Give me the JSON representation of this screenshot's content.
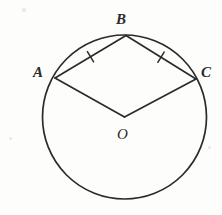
{
  "figure": {
    "kind": "circle-geometry-diagram",
    "background_color": "#fdfdfc",
    "ink_color": "#2b2b2b",
    "width": 222,
    "height": 215,
    "circle": {
      "center_x": 124.5,
      "center_y": 117,
      "radius": 82,
      "stroke_width": 1.7
    },
    "points": [
      {
        "name": "A",
        "x": 55,
        "y": 78,
        "label": "A",
        "label_x": 33,
        "label_y": 65
      },
      {
        "name": "B",
        "x": 126,
        "y": 35.5,
        "label": "B",
        "label_x": 116,
        "label_y": 12
      },
      {
        "name": "C",
        "x": 196,
        "y": 79,
        "label": "C",
        "label_x": 201,
        "label_y": 65
      },
      {
        "name": "O",
        "x": 124.5,
        "y": 117,
        "label": "O",
        "label_x": 117,
        "label_y": 127
      }
    ],
    "segments": [
      {
        "name": "chord-AB",
        "from": "A",
        "to": "B",
        "ticks": 1
      },
      {
        "name": "chord-BC",
        "from": "B",
        "to": "C",
        "ticks": 1
      },
      {
        "name": "radius-OA",
        "from": "O",
        "to": "A",
        "ticks": 0
      },
      {
        "name": "radius-OC",
        "from": "O",
        "to": "C",
        "ticks": 0
      }
    ],
    "tick_marks": [
      {
        "name": "tick-AB",
        "x": 90.5,
        "y": 56.8,
        "angle_deg": -30.9
      },
      {
        "name": "tick-BC",
        "x": 161,
        "y": 57.2,
        "angle_deg": 31.6
      }
    ]
  }
}
